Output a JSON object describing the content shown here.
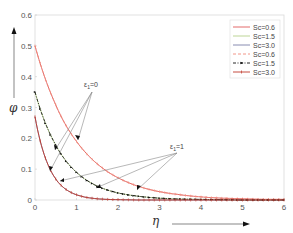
{
  "chart_data": {
    "type": "line",
    "title": "",
    "xlabel": "η",
    "ylabel": "φ",
    "xlim": [
      0,
      6
    ],
    "ylim": [
      0,
      0.6
    ],
    "x_ticks": [
      "0",
      "1",
      "2",
      "3",
      "4",
      "5",
      "6"
    ],
    "y_ticks": [
      "0",
      "0.1",
      "0.2",
      "0.3",
      "0.4",
      "0.5",
      "0.6"
    ],
    "grid": false,
    "legend_position": "upper right",
    "x": [
      0,
      0.25,
      0.5,
      0.75,
      1,
      1.5,
      2,
      2.5,
      3,
      3.5,
      4,
      4.5,
      5,
      5.5,
      6
    ],
    "series": [
      {
        "name": "Sc=0.6",
        "group": "ε1=0",
        "color": "#e05a5a",
        "style": "solid",
        "values": [
          0.5,
          0.392,
          0.308,
          0.241,
          0.19,
          0.117,
          0.072,
          0.044,
          0.027,
          0.017,
          0.01,
          0.006,
          0.004,
          0.002,
          0.002
        ]
      },
      {
        "name": "Sc=1.5",
        "group": "ε1=0",
        "color": "#b5d08a",
        "style": "solid",
        "values": [
          0.35,
          0.249,
          0.178,
          0.126,
          0.09,
          0.045,
          0.023,
          0.012,
          0.006,
          0.003,
          0.002,
          0.001,
          0.0,
          0.0,
          0.0
        ]
      },
      {
        "name": "Sc=3.0",
        "group": "ε1=0",
        "color": "#7a7fa8",
        "style": "solid",
        "values": [
          0.27,
          0.136,
          0.068,
          0.034,
          0.017,
          0.004,
          0.001,
          0.0,
          0.0,
          0.0,
          0.0,
          0.0,
          0.0,
          0.0,
          0.0
        ]
      },
      {
        "name": "Sc=0.6",
        "group": "ε1=1",
        "color": "#f08a7a",
        "style": "dashed",
        "values": [
          0.5,
          0.392,
          0.308,
          0.241,
          0.19,
          0.117,
          0.072,
          0.044,
          0.027,
          0.017,
          0.01,
          0.006,
          0.004,
          0.002,
          0.002
        ]
      },
      {
        "name": "Sc=1.5",
        "group": "ε1=1",
        "color": "#111111",
        "style": "dash-dot-marker",
        "values": [
          0.35,
          0.249,
          0.178,
          0.126,
          0.09,
          0.045,
          0.023,
          0.012,
          0.006,
          0.003,
          0.002,
          0.001,
          0.0,
          0.0,
          0.0
        ]
      },
      {
        "name": "Sc=3.0",
        "group": "ε1=1",
        "color": "#c0392b",
        "style": "solid-marker",
        "values": [
          0.27,
          0.136,
          0.068,
          0.034,
          0.017,
          0.004,
          0.001,
          0.0,
          0.0,
          0.0,
          0.0,
          0.0,
          0.0,
          0.0,
          0.0
        ]
      }
    ],
    "annotations": [
      {
        "text_main": "ε",
        "text_sub": "1",
        "text_rest": "=0"
      },
      {
        "text_main": "ε",
        "text_sub": "1",
        "text_rest": "=1"
      }
    ]
  }
}
